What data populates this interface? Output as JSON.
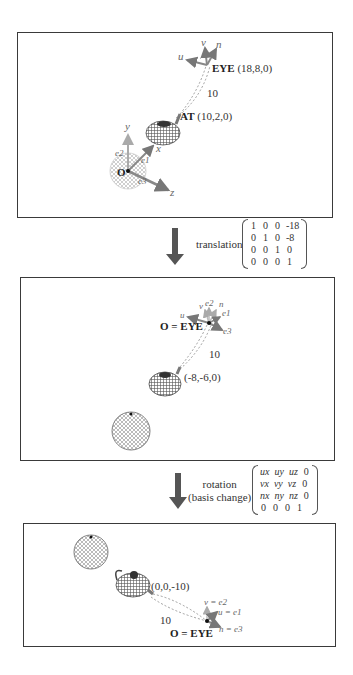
{
  "panels": [
    {
      "id": "world-space",
      "labels": {
        "eye": "EYE",
        "eye_coord": "(18,8,0)",
        "at": "AT",
        "at_coord": "(10,2,0)",
        "distance": "10",
        "origin": "O",
        "axes": {
          "x": "x",
          "y": "y",
          "z": "z",
          "e1": "e1",
          "e2": "e2",
          "e3": "e3",
          "u": "u",
          "v": "v",
          "n": "n"
        }
      }
    },
    {
      "id": "after-translation",
      "labels": {
        "origin_eye": "O = EYE",
        "teapot_coord": "(-8,-6,0)",
        "distance": "10",
        "axes": {
          "u": "u",
          "v": "v",
          "n": "n",
          "e1": "e1",
          "e2": "e2",
          "e3": "e3"
        }
      }
    },
    {
      "id": "after-rotation",
      "labels": {
        "origin_eye": "O = EYE",
        "teapot_coord": "(0,0,-10)",
        "distance": "10",
        "v_eq": "v = e2",
        "u_eq": "u = e1",
        "n_eq": "n = e3"
      }
    }
  ],
  "steps": [
    {
      "label": "translation",
      "matrix": [
        [
          "1",
          "0",
          "0",
          "-18"
        ],
        [
          "0",
          "1",
          "0",
          "-8"
        ],
        [
          "0",
          "0",
          "1",
          "0"
        ],
        [
          "0",
          "0",
          "0",
          "1"
        ]
      ]
    },
    {
      "label_line1": "rotation",
      "label_line2": "(basis change)",
      "matrix": [
        [
          "ux",
          "uy",
          "uz",
          "0"
        ],
        [
          "vx",
          "vy",
          "vz",
          "0"
        ],
        [
          "nx",
          "ny",
          "nz",
          "0"
        ],
        [
          "0",
          "0",
          "0",
          "1"
        ]
      ]
    }
  ],
  "colors": {
    "border": "#3a3a3a",
    "arrow": "#555555",
    "axis_gray": "#777777",
    "axis_light": "#aaaaaa"
  }
}
